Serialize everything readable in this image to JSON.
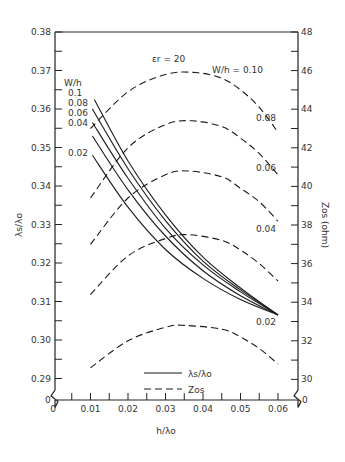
{
  "chart_data": {
    "type": "line",
    "title": "",
    "annotation": "εr = 20",
    "xlabel": "h/λo",
    "ylabel_left": "λs/λo",
    "ylabel_right": "Zos (ohm)",
    "xlim": [
      0,
      0.065
    ],
    "ylim_left": [
      0.285,
      0.38
    ],
    "ylim_right": [
      29,
      48
    ],
    "x_ticks": [
      0,
      0.01,
      0.02,
      0.03,
      0.04,
      0.05,
      0.06
    ],
    "x_tick_labels": [
      "0",
      "0.01",
      "0.02",
      "0.03",
      "0.04",
      "0.05",
      "0.06"
    ],
    "y_left_ticks": [
      0.29,
      0.3,
      0.31,
      0.32,
      0.33,
      0.34,
      0.35,
      0.36,
      0.37,
      0.38
    ],
    "y_left_tick_labels": [
      "0.29",
      "0.30",
      "0.31",
      "0.32",
      "0.33",
      "0.34",
      "0.35",
      "0.36",
      "0.37",
      "0.38"
    ],
    "y_right_ticks": [
      30,
      32,
      34,
      36,
      38,
      40,
      42,
      44,
      46,
      48
    ],
    "y_right_tick_labels": [
      "30",
      "32",
      "34",
      "36",
      "38",
      "40",
      "42",
      "44",
      "46",
      "48"
    ],
    "axis_origin_labels": {
      "left": "0",
      "right": "0"
    },
    "grid": false,
    "legend": {
      "placement": "bottom-center",
      "entries": [
        {
          "label": "λs/λo",
          "style": "solid"
        },
        {
          "label": "Zos",
          "style": "dashed"
        }
      ]
    },
    "solid_group_label": "W/h",
    "solid_series": [
      {
        "name": "0.1",
        "x": [
          0.011,
          0.02,
          0.03,
          0.04,
          0.05,
          0.06
        ],
        "values": [
          0.3625,
          0.3465,
          0.3325,
          0.3215,
          0.3135,
          0.3065
        ]
      },
      {
        "name": "0.08",
        "x": [
          0.0105,
          0.02,
          0.03,
          0.04,
          0.05,
          0.06
        ],
        "values": [
          0.36,
          0.3445,
          0.331,
          0.3205,
          0.313,
          0.3065
        ]
      },
      {
        "name": "0.06",
        "x": [
          0.0105,
          0.02,
          0.03,
          0.04,
          0.05,
          0.06
        ],
        "values": [
          0.3565,
          0.342,
          0.329,
          0.3195,
          0.3125,
          0.3065
        ]
      },
      {
        "name": "0.04",
        "x": [
          0.0105,
          0.02,
          0.03,
          0.04,
          0.05,
          0.06
        ],
        "values": [
          0.353,
          0.339,
          0.327,
          0.318,
          0.3115,
          0.3065
        ]
      },
      {
        "name": "0.02",
        "x": [
          0.0105,
          0.02,
          0.03,
          0.04,
          0.05,
          0.06
        ],
        "values": [
          0.348,
          0.3345,
          0.3235,
          0.316,
          0.3105,
          0.3065
        ]
      }
    ],
    "dashed_series": [
      {
        "name": "W/h = 0.10",
        "x": [
          0.01,
          0.02,
          0.03,
          0.038,
          0.045,
          0.05,
          0.055,
          0.06
        ],
        "values": [
          43.0,
          44.9,
          45.8,
          45.9,
          45.6,
          45.0,
          44.1,
          42.8
        ]
      },
      {
        "name": "0.08",
        "x": [
          0.01,
          0.02,
          0.03,
          0.037,
          0.045,
          0.05,
          0.055,
          0.06
        ],
        "values": [
          39.4,
          42.0,
          43.2,
          43.4,
          43.1,
          42.5,
          41.7,
          40.6
        ]
      },
      {
        "name": "0.06",
        "x": [
          0.01,
          0.02,
          0.03,
          0.036,
          0.045,
          0.05,
          0.055,
          0.06
        ],
        "values": [
          37.0,
          39.4,
          40.6,
          40.8,
          40.5,
          39.9,
          39.2,
          38.2
        ]
      },
      {
        "name": "0.04",
        "x": [
          0.01,
          0.02,
          0.03,
          0.036,
          0.045,
          0.05,
          0.055,
          0.06
        ],
        "values": [
          34.4,
          36.4,
          37.3,
          37.5,
          37.2,
          36.7,
          36.0,
          35.1
        ]
      },
      {
        "name": "0.02",
        "x": [
          0.01,
          0.02,
          0.03,
          0.035,
          0.045,
          0.05,
          0.055,
          0.06
        ],
        "values": [
          30.6,
          32.0,
          32.7,
          32.8,
          32.6,
          32.2,
          31.6,
          30.8
        ]
      }
    ]
  }
}
